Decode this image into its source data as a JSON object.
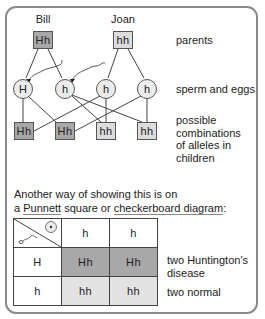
{
  "parents": {
    "father": {
      "name": "Bill",
      "genotype": "Hh",
      "shade": "dark"
    },
    "mother": {
      "name": "Joan",
      "genotype": "hh",
      "shade": "light"
    }
  },
  "gametes": [
    "H",
    "h",
    "h",
    "h"
  ],
  "children": [
    {
      "genotype": "Hh",
      "shade": "dark"
    },
    {
      "genotype": "Hh",
      "shade": "dark"
    },
    {
      "genotype": "hh",
      "shade": "light"
    },
    {
      "genotype": "hh",
      "shade": "light"
    }
  ],
  "row_labels": {
    "parents": "parents",
    "gametes": "sperm and eggs",
    "children_lines": [
      "possible",
      "combinations",
      "of alleles in",
      "children"
    ]
  },
  "intro": {
    "line1": "Another way of showing this is on",
    "line2_prefix": "a ",
    "punnett_link": "Punnett",
    "line2_mid": " square or ",
    "checkerboard_link": "checkerboard diagram",
    "line2_suffix": ":"
  },
  "punnett": {
    "corner_icons": [
      "egg-icon",
      "sperm-icon"
    ],
    "column_headers": [
      "h",
      "h"
    ],
    "rows": [
      {
        "header": "H",
        "cells": [
          "Hh",
          "Hh"
        ],
        "note_lines": [
          "two Huntington's",
          "disease"
        ]
      },
      {
        "header": "h",
        "cells": [
          "hh",
          "hh"
        ],
        "note_lines": [
          "two normal"
        ]
      }
    ]
  },
  "colors": {
    "dark_fill": "#a8a8a8",
    "light_fill": "#dcdcdc",
    "circle_fill": "#ececec",
    "frame": "#8a8a8a"
  }
}
